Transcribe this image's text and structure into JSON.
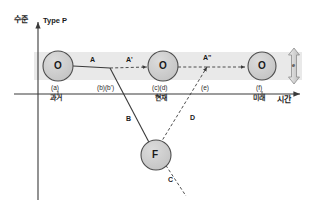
{
  "figure": {
    "title": "Type P",
    "axes": {
      "y_label": "수준",
      "x_label": "시간"
    },
    "band": {
      "color": "#e8e8e8",
      "note": "horizontal gray tolerance band around the O level"
    },
    "colors": {
      "node_fill": "#c9c9c9",
      "node_stroke": "#4d4d4d",
      "line": "#3a3a3a",
      "band": "#e9e9e9",
      "arrow": "#d8d8d8",
      "axis": "#3a3a3a"
    },
    "nodes": [
      {
        "id": "o-past",
        "label": "O",
        "tick": "(a)",
        "time": "과거"
      },
      {
        "id": "o-present",
        "label": "O",
        "tick": "(c)(d)",
        "time": "현재"
      },
      {
        "id": "o-future",
        "label": "O",
        "tick": "(f)",
        "time": "미래"
      },
      {
        "id": "f-node",
        "label": "F",
        "tick": "",
        "time": ""
      }
    ],
    "ticks": [
      {
        "id": "tick-a",
        "label": "(a)",
        "sub": "과거"
      },
      {
        "id": "tick-b",
        "label": "(b)(b')",
        "sub": ""
      },
      {
        "id": "tick-cd",
        "label": "(c)(d)",
        "sub": "현재"
      },
      {
        "id": "tick-e",
        "label": "(e)",
        "sub": ""
      },
      {
        "id": "tick-f",
        "label": "(f)",
        "sub": "미래"
      }
    ],
    "segments": [
      {
        "id": "seg-a",
        "label": "A",
        "style": "solid"
      },
      {
        "id": "seg-a-prime",
        "label": "A'",
        "style": "dashed"
      },
      {
        "id": "seg-a-dprime",
        "label": "A\"",
        "style": "dashed"
      },
      {
        "id": "seg-b",
        "label": "B",
        "style": "solid"
      },
      {
        "id": "seg-c",
        "label": "C",
        "style": "dashed"
      },
      {
        "id": "seg-d",
        "label": "D",
        "style": "dashed"
      }
    ],
    "range_arrow": {
      "id": "range-arrow",
      "label": "e",
      "direction": "vertical-double"
    }
  }
}
